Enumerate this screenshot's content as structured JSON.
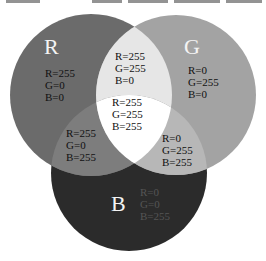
{
  "top_strip": {
    "legible": false,
    "note": "clipped text fragments along the top edge, unreadable"
  },
  "diagram": {
    "type": "rgb-additive-venn",
    "colors": {
      "red_only": "#6b6b6b",
      "green_only": "#a3a3a3",
      "blue_only": "#2b2b2b",
      "red_green": "#e6e6e6",
      "red_blue": "#7d7d7d",
      "green_blue": "#b7b7b7",
      "center": "#ffffff"
    },
    "circles": [
      {
        "id": "R",
        "label": "R",
        "values": {
          "r": "R=255",
          "g": "G=0",
          "b": "B=0"
        }
      },
      {
        "id": "G",
        "label": "G",
        "values": {
          "r": "R=0",
          "g": "G=255",
          "b": "B=0"
        }
      },
      {
        "id": "B",
        "label": "B",
        "values": {
          "r": "R=0",
          "g": "G=0",
          "b": "B=255"
        }
      }
    ],
    "overlaps": {
      "red_green": {
        "r": "R=255",
        "g": "G=255",
        "b": "B=0"
      },
      "red_blue": {
        "r": "R=255",
        "g": "G=0",
        "b": "B=255"
      },
      "green_blue": {
        "r": "R=0",
        "g": "G=255",
        "b": "B=255"
      },
      "center": {
        "r": "R=255",
        "g": "G=255",
        "b": "B=255"
      }
    }
  }
}
